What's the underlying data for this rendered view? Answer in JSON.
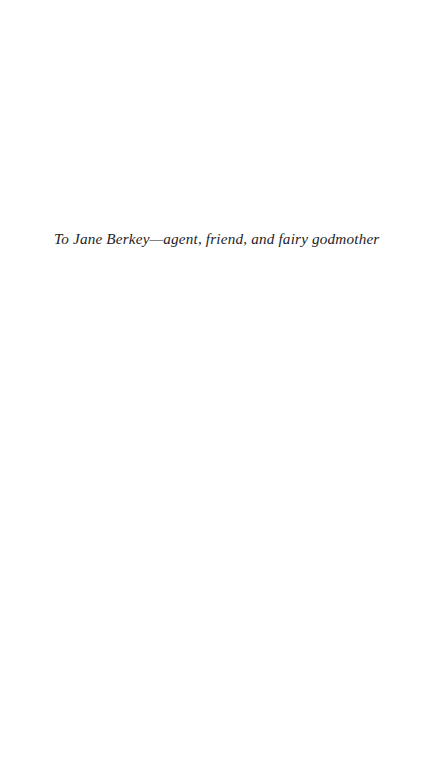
{
  "page": {
    "kind": "book-dedication-page",
    "background_color": "#ffffff",
    "width_px": 442,
    "height_px": 766
  },
  "dedication": {
    "text": "To Jane Berkey—agent, friend, and fairy godmother",
    "style": "italic",
    "color": "#232326",
    "alignment": "left"
  }
}
